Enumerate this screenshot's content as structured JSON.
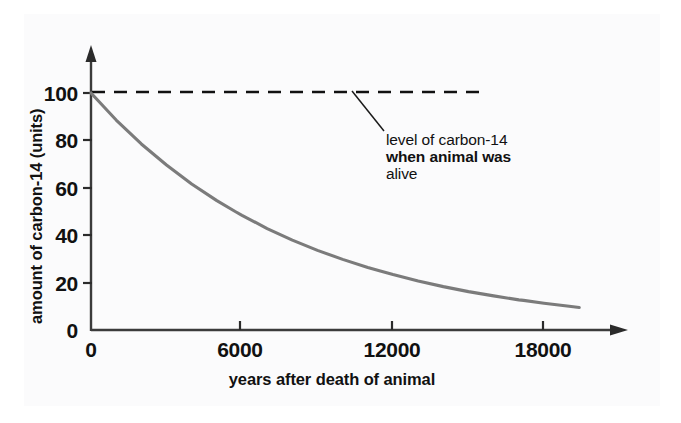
{
  "chart_data": {
    "type": "line",
    "title": "",
    "xlabel": "years after death of animal",
    "ylabel": "amount of carbon-14 (units)",
    "xlim": [
      0,
      19400
    ],
    "ylim": [
      0,
      105
    ],
    "xticks": [
      0,
      6000,
      12000,
      18000
    ],
    "xtick_labels": [
      "0",
      "6000",
      "12000",
      "18000"
    ],
    "yticks": [
      0,
      20,
      40,
      60,
      80,
      100
    ],
    "ytick_labels": [
      "0",
      "20",
      "40",
      "60",
      "80",
      "100"
    ],
    "grid": false,
    "legend": "none",
    "series": [
      {
        "name": "carbon-14 remaining",
        "style": "solid",
        "color": "#7b7b7b",
        "x": [
          0,
          1000,
          2000,
          3000,
          4000,
          5000,
          5730,
          6000,
          7000,
          8000,
          9000,
          10000,
          11000,
          11460,
          12000,
          13000,
          14000,
          15000,
          16000,
          17000,
          17190,
          18000,
          19000,
          19400
        ],
        "y": [
          100,
          88.6,
          78.5,
          69.6,
          61.6,
          54.6,
          50,
          48.4,
          42.8,
          37.9,
          33.6,
          29.8,
          26.4,
          25,
          23.4,
          20.7,
          18.3,
          16.2,
          14.4,
          12.7,
          12.5,
          11.3,
          10,
          9.5
        ]
      },
      {
        "name": "level of carbon-14 when animal was alive",
        "style": "dashed",
        "color": "#111111",
        "x": [
          0,
          15500
        ],
        "y": [
          100,
          100
        ]
      }
    ],
    "annotations": [
      {
        "text_lines": [
          "level of carbon-14",
          "when animal was",
          "alive"
        ],
        "points_to_series": "level of carbon-14 when animal was alive",
        "points_to_value": 100
      }
    ]
  },
  "axes": {
    "y_axis_title": "amount of carbon-14 (units)",
    "x_axis_title": "years after death of animal",
    "y_tick_labels": [
      "100",
      "80",
      "60",
      "40",
      "20",
      "0"
    ],
    "x_tick_labels": [
      "0",
      "6000",
      "12000",
      "18000"
    ],
    "x_origin_label": "0"
  },
  "annotation": {
    "line1": "level of carbon-14",
    "line2": "when animal was",
    "line3": "alive"
  },
  "colors": {
    "curve": "#7b7b7b",
    "axis": "#3b3b3b",
    "dashed": "#111111",
    "text": "#111111",
    "paper": "#fbfbfc",
    "background": "#ffffff"
  }
}
